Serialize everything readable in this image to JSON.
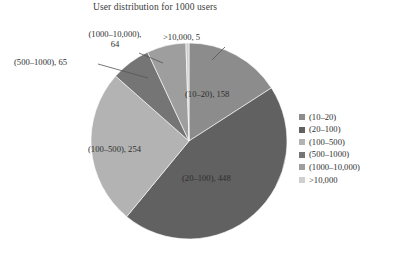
{
  "chart_data": {
    "type": "pie",
    "title": "User distribution for 1000 users",
    "xlabel": "",
    "ylabel": "",
    "grid": false,
    "legend_position": "right",
    "start_angle_deg": 0,
    "direction": "clockwise",
    "total_users": 1000,
    "categories": [
      "(10–20)",
      "(20–100)",
      "(100–500)",
      "(500–1000)",
      "(1000–10,000)",
      ">10,000"
    ],
    "values": [
      158,
      448,
      254,
      65,
      64,
      5
    ],
    "colors": [
      "#8c8c8c",
      "#616161",
      "#b3b3b3",
      "#757575",
      "#9e9e9e",
      "#cfcfcf"
    ],
    "slices": [
      {
        "label": "(10–20)",
        "value": 158,
        "color": "#8c8c8c",
        "annotation": "(10–20), 158",
        "label_placement": "inside"
      },
      {
        "label": "(20–100)",
        "value": 448,
        "color": "#616161",
        "annotation": "(20–100), 448",
        "label_placement": "inside"
      },
      {
        "label": "(100–500)",
        "value": 254,
        "color": "#b3b3b3",
        "annotation": "(100–500), 254",
        "label_placement": "inside"
      },
      {
        "label": "(500–1000)",
        "value": 65,
        "color": "#757575",
        "annotation": "(500–1000), 65",
        "label_placement": "outside-leader"
      },
      {
        "label": "(1000–10,000)",
        "value": 64,
        "color": "#9e9e9e",
        "annotation": "(1000–10,000), 64",
        "label_placement": "outside-leader"
      },
      {
        "label": ">10,000",
        "value": 5,
        "color": "#cfcfcf",
        "annotation": ">10,000, 5",
        "label_placement": "outside-leader"
      }
    ]
  },
  "annotations": {
    "slice_10_20": "(10–20), 158",
    "slice_20_100": "(20–100), 448",
    "slice_100_500": "(100–500), 254",
    "slice_500_1000": "(500–1000), 65",
    "slice_1000_10000": "(1000–10,000), 64",
    "slice_gt_10000": ">10,000, 5"
  },
  "legend": {
    "items": [
      {
        "label": "(10–20)",
        "color": "#8c8c8c"
      },
      {
        "label": "(20–100)",
        "color": "#616161"
      },
      {
        "label": "(100–500)",
        "color": "#b3b3b3"
      },
      {
        "label": "(500–1000)",
        "color": "#757575"
      },
      {
        "label": "(1000–10,000)",
        "color": "#9e9e9e"
      },
      {
        "label": ">10,000",
        "color": "#cfcfcf"
      }
    ]
  },
  "theme": {
    "background": "#ffffff",
    "text_color": "#2e2e2e",
    "leader_line_color": "#555555"
  }
}
